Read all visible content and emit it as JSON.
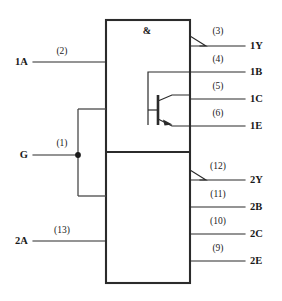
{
  "diagram": {
    "gate_symbol": "&",
    "colors": {
      "line": "#2b2b2b",
      "bracket": "#4a4a4a",
      "text": "#1a1a1a",
      "background": "#ffffff"
    },
    "sections": [
      {
        "name": "upper-gate",
        "symbol": "&"
      },
      {
        "name": "lower-gate",
        "symbol": ""
      }
    ],
    "inputs": [
      {
        "id": "1A",
        "label": "1A",
        "pin": "(2)",
        "side": "left"
      },
      {
        "id": "G",
        "label": "G",
        "pin": "(1)",
        "side": "left"
      },
      {
        "id": "2A",
        "label": "2A",
        "pin": "(13)",
        "side": "left"
      }
    ],
    "outputs": [
      {
        "id": "1Y",
        "label": "1Y",
        "pin": "(3)",
        "side": "right",
        "inverting": true
      },
      {
        "id": "1B",
        "label": "1B",
        "pin": "(4)",
        "side": "right",
        "inverting": false
      },
      {
        "id": "1C",
        "label": "1C",
        "pin": "(5)",
        "side": "right",
        "inverting": false
      },
      {
        "id": "1E",
        "label": "1E",
        "pin": "(6)",
        "side": "right",
        "inverting": false
      },
      {
        "id": "2Y",
        "label": "2Y",
        "pin": "(12)",
        "side": "right",
        "inverting": true
      },
      {
        "id": "2B",
        "label": "2B",
        "pin": "(11)",
        "side": "right",
        "inverting": false
      },
      {
        "id": "2C",
        "label": "2C",
        "pin": "(10)",
        "side": "right",
        "inverting": false
      },
      {
        "id": "2E",
        "label": "2E",
        "pin": "(9)",
        "side": "right",
        "inverting": false
      }
    ]
  }
}
